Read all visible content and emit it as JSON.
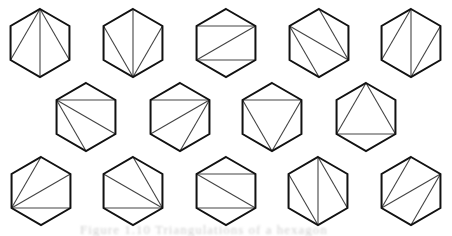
{
  "figure": {
    "caption": "Figure 1.10  Triangulations of a hexagon",
    "stroke_color": "#111111",
    "diagonal_color": "#444444",
    "radius": 34,
    "vertex_order": [
      "top",
      "upper-right",
      "lower-right",
      "bottom",
      "lower-left",
      "upper-left"
    ],
    "hexagons": [
      {
        "row": 1,
        "cx": 40,
        "cy": 43,
        "diagonals": [
          [
            0,
            2
          ],
          [
            0,
            3
          ],
          [
            0,
            4
          ]
        ]
      },
      {
        "row": 1,
        "cx": 133,
        "cy": 43,
        "diagonals": [
          [
            3,
            5
          ],
          [
            3,
            0
          ],
          [
            3,
            1
          ]
        ]
      },
      {
        "row": 1,
        "cx": 226,
        "cy": 43,
        "diagonals": [
          [
            5,
            1
          ],
          [
            4,
            1
          ],
          [
            4,
            2
          ]
        ]
      },
      {
        "row": 1,
        "cx": 319,
        "cy": 43,
        "diagonals": [
          [
            5,
            2
          ],
          [
            0,
            2
          ],
          [
            5,
            3
          ]
        ]
      },
      {
        "row": 1,
        "cx": 411,
        "cy": 43,
        "diagonals": [
          [
            0,
            4
          ],
          [
            0,
            3
          ],
          [
            3,
            1
          ]
        ]
      },
      {
        "row": 2,
        "cx": 86,
        "cy": 117,
        "diagonals": [
          [
            5,
            1
          ],
          [
            5,
            2
          ],
          [
            5,
            3
          ]
        ]
      },
      {
        "row": 2,
        "cx": 180,
        "cy": 117,
        "diagonals": [
          [
            5,
            1
          ],
          [
            1,
            4
          ],
          [
            1,
            3
          ]
        ]
      },
      {
        "row": 2,
        "cx": 272,
        "cy": 117,
        "diagonals": [
          [
            5,
            1
          ],
          [
            5,
            3
          ],
          [
            1,
            3
          ]
        ]
      },
      {
        "row": 2,
        "cx": 366,
        "cy": 117,
        "diagonals": [
          [
            0,
            4
          ],
          [
            0,
            2
          ],
          [
            4,
            2
          ]
        ]
      },
      {
        "row": 3,
        "cx": 41,
        "cy": 191,
        "diagonals": [
          [
            4,
            0
          ],
          [
            4,
            1
          ],
          [
            4,
            2
          ]
        ]
      },
      {
        "row": 3,
        "cx": 133,
        "cy": 191,
        "diagonals": [
          [
            5,
            2
          ],
          [
            0,
            2
          ],
          [
            4,
            2
          ]
        ]
      },
      {
        "row": 3,
        "cx": 226,
        "cy": 191,
        "diagonals": [
          [
            5,
            1
          ],
          [
            5,
            2
          ],
          [
            4,
            2
          ]
        ]
      },
      {
        "row": 3,
        "cx": 318,
        "cy": 191,
        "diagonals": [
          [
            0,
            3
          ],
          [
            0,
            2
          ],
          [
            5,
            3
          ]
        ]
      },
      {
        "row": 3,
        "cx": 411,
        "cy": 191,
        "diagonals": [
          [
            4,
            0
          ],
          [
            4,
            1
          ],
          [
            1,
            3
          ]
        ]
      }
    ]
  }
}
